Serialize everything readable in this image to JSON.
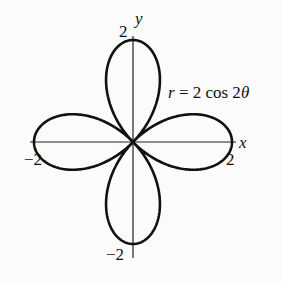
{
  "chart_data": {
    "type": "line",
    "subtype": "polar",
    "title": "",
    "equation": "r = 2 cos 2θ",
    "xlabel": "x",
    "ylabel": "y",
    "xlim": [
      -2,
      2
    ],
    "ylim": [
      -2,
      2
    ],
    "tick_labels": {
      "x": [
        "-2",
        "2"
      ],
      "y": [
        "2",
        "-2"
      ]
    },
    "grid": false,
    "legend": null,
    "series": [
      {
        "name": "r = 2 cos 2θ",
        "r_max": 2,
        "petals": 4,
        "petal_directions_deg": [
          0,
          90,
          180,
          270
        ]
      }
    ]
  },
  "labels": {
    "x_axis": "x",
    "y_axis": "y",
    "x_neg": "−2",
    "x_pos": "2",
    "y_pos": "2",
    "y_neg": "−2",
    "eq_r": "r",
    "eq_rest": " = 2 cos 2",
    "eq_theta": "θ"
  },
  "colors": {
    "curve": "#111111",
    "axis": "#222222",
    "background": "#fbfbfb"
  }
}
